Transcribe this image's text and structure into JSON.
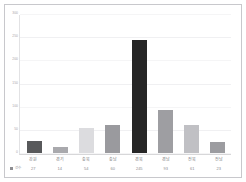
{
  "chart_data": {
    "type": "bar",
    "title": "",
    "subtitle": "",
    "xlabel": "",
    "ylabel": "",
    "grid": true,
    "legend_position": "bottom-left",
    "ylim": [
      0,
      300
    ],
    "yticks": [
      300,
      250,
      200,
      150,
      100,
      50,
      0
    ],
    "ytick_labels": [
      "300",
      "250",
      "200",
      "150",
      "100",
      "50",
      "0"
    ],
    "categories": [
      "강원",
      "경기",
      "충북",
      "충남",
      "경북",
      "경남",
      "전북",
      "전남"
    ],
    "series": [
      {
        "name": "건수",
        "values": [
          27,
          14,
          54,
          60,
          245,
          93,
          61,
          23
        ]
      }
    ],
    "bar_colors": [
      "#58595b",
      "#a9a9ad",
      "#dcdcdf",
      "#9a9a9e",
      "#262626",
      "#9e9ea2",
      "#c0c0c4",
      "#9c9ca0"
    ]
  },
  "series_key": {
    "label": "건수",
    "swatch_color": "#8e8e92"
  }
}
